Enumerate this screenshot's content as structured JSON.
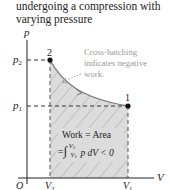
{
  "caption": {
    "line1": "undergoing a compression with",
    "line2": "varying pressure"
  },
  "diagram": {
    "y_axis_label": "p",
    "x_axis_label": "V",
    "origin_label": "O",
    "p2_label": "p",
    "p2_sub": "2",
    "p1_label": "p",
    "p1_sub": "1",
    "v2_label": "V",
    "v2_sub": "2",
    "v1_label": "V",
    "v1_sub": "1",
    "point2_label": "2",
    "point1_label": "1",
    "annotation": {
      "line1": "Cross-hatching",
      "line2": "indicates negative",
      "line3": "work."
    },
    "work_box": {
      "line1": "Work = Area",
      "eq_prefix": "=",
      "integral": "∫",
      "upper": "V",
      "upper_sub": "2",
      "lower": "V",
      "lower_sub": "1",
      "integrand": "p dV < 0"
    },
    "colors": {
      "fill": "#d9d9d9",
      "hatch": "#9e9e9e",
      "curve": "#7a7a7a",
      "axis": "#222222",
      "annotation": "#9a9a9a"
    }
  }
}
